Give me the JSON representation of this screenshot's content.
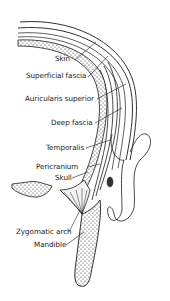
{
  "figure": {
    "type": "anatomical cross-section diagram",
    "labels": [
      {
        "id": "skin",
        "text": "Skin"
      },
      {
        "id": "superficial-fascia",
        "text": "Superficial fascia"
      },
      {
        "id": "auricularis-superior",
        "text": "Auricularis superior"
      },
      {
        "id": "deep-fascia",
        "text": "Deep fascia"
      },
      {
        "id": "temporalis",
        "text": "Temporalis"
      },
      {
        "id": "pericranium",
        "text": "Pericranium"
      },
      {
        "id": "skull",
        "text": "Skull"
      },
      {
        "id": "zygomatic-arch",
        "text": "Zygomatic arch"
      },
      {
        "id": "mandible",
        "text": "Mandible"
      }
    ],
    "colors": {
      "line": "#1a1a1a",
      "background": "#ffffff"
    }
  }
}
